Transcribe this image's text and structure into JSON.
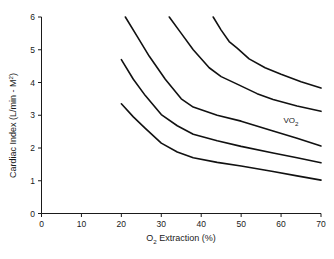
{
  "chart_data": {
    "type": "line",
    "title": "",
    "subtitle": "",
    "xlabel": "O2 Extraction (%)",
    "xlabel_base": "O",
    "xlabel_sub": "2",
    "xlabel_rest": " Extraction (%)",
    "ylabel": "Cardiac Index (L/min - M2)",
    "ylabel_base": "Cardiac Index (L/min - M",
    "ylabel_sub": "2",
    "ylabel_rest": ")",
    "xlim": [
      0,
      70
    ],
    "ylim": [
      0,
      6
    ],
    "xticks": [
      0,
      10,
      20,
      30,
      40,
      50,
      60,
      70
    ],
    "yticks": [
      0,
      1,
      2,
      3,
      4,
      5,
      6
    ],
    "grid": false,
    "legend": "none",
    "line_color": "#111111",
    "annotations": [
      {
        "name": "vo2-label",
        "text": "VO2",
        "base": "VO",
        "sub": "2",
        "x": 62.5,
        "y": 2.75
      }
    ],
    "series": [
      {
        "name": "iso-VO2 curve 1 (lowest)",
        "x": [
          20,
          23,
          26,
          30,
          34,
          38,
          44,
          50,
          58,
          64,
          70
        ],
        "y": [
          3.35,
          2.95,
          2.6,
          2.15,
          1.88,
          1.7,
          1.56,
          1.45,
          1.28,
          1.15,
          1.02
        ]
      },
      {
        "name": "iso-VO2 curve 2",
        "x": [
          20,
          23,
          26,
          30,
          34,
          38,
          44,
          50,
          58,
          64,
          70
        ],
        "y": [
          4.7,
          4.1,
          3.6,
          3.02,
          2.68,
          2.42,
          2.22,
          2.05,
          1.85,
          1.7,
          1.55
        ]
      },
      {
        "name": "iso-VO2 curve 3",
        "x": [
          21,
          24,
          27,
          31,
          35,
          38,
          44,
          50,
          58,
          64,
          70
        ],
        "y": [
          6.0,
          5.4,
          4.8,
          4.1,
          3.5,
          3.25,
          3.0,
          2.82,
          2.52,
          2.3,
          2.06
        ]
      },
      {
        "name": "iso-VO2 curve 4",
        "x": [
          32,
          35,
          38,
          42,
          45,
          49,
          54,
          58,
          64,
          70
        ],
        "y": [
          6.0,
          5.5,
          5.0,
          4.45,
          4.18,
          3.95,
          3.66,
          3.48,
          3.28,
          3.12
        ]
      },
      {
        "name": "iso-VO2 curve 5 (highest)",
        "x": [
          43,
          45,
          47,
          49,
          52,
          56,
          60,
          65,
          70
        ],
        "y": [
          6.0,
          5.6,
          5.25,
          5.05,
          4.72,
          4.45,
          4.25,
          4.02,
          3.83
        ]
      }
    ]
  }
}
